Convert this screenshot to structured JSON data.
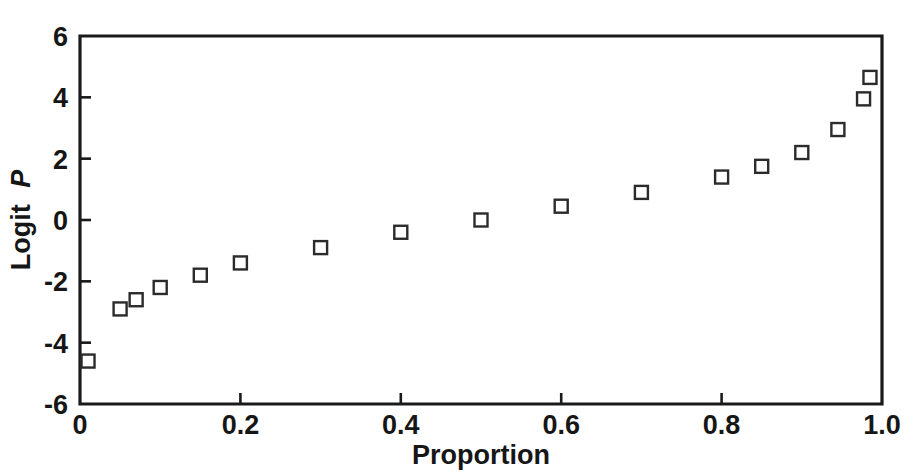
{
  "chart_data": {
    "type": "scatter",
    "title": "",
    "xlabel": "Proportion",
    "ylabel": "Logit P",
    "ylabel_plain": "Logit",
    "ylabel_italic": "P",
    "xlim": [
      0,
      1.0
    ],
    "ylim": [
      -6,
      6
    ],
    "grid": false,
    "legend": null,
    "marker": "open-square",
    "marker_color": "#2b2b2b",
    "x_ticks": [
      0,
      0.2,
      0.4,
      0.6,
      0.8,
      1.0
    ],
    "x_tick_labels": [
      "0",
      "0.2",
      "0.4",
      "0.6",
      "0.8",
      "1.0"
    ],
    "y_ticks": [
      -6,
      -4,
      -2,
      0,
      2,
      4,
      6
    ],
    "y_tick_labels": [
      "-6",
      "-4",
      "-2",
      "0",
      "2",
      "4",
      "6"
    ],
    "x": [
      0.01,
      0.05,
      0.07,
      0.1,
      0.15,
      0.2,
      0.3,
      0.4,
      0.5,
      0.6,
      0.7,
      0.8,
      0.85,
      0.9,
      0.945,
      0.977,
      0.985
    ],
    "values": [
      -4.6,
      -2.9,
      -2.6,
      -2.2,
      -1.8,
      -1.4,
      -0.9,
      -0.4,
      0.0,
      0.45,
      0.9,
      1.4,
      1.75,
      2.2,
      2.95,
      3.95,
      4.65
    ],
    "points": [
      {
        "x": 0.01,
        "y": -4.6
      },
      {
        "x": 0.05,
        "y": -2.9
      },
      {
        "x": 0.07,
        "y": -2.6
      },
      {
        "x": 0.1,
        "y": -2.2
      },
      {
        "x": 0.15,
        "y": -1.8
      },
      {
        "x": 0.2,
        "y": -1.4
      },
      {
        "x": 0.3,
        "y": -0.9
      },
      {
        "x": 0.4,
        "y": -0.4
      },
      {
        "x": 0.5,
        "y": 0.0
      },
      {
        "x": 0.6,
        "y": 0.45
      },
      {
        "x": 0.7,
        "y": 0.9
      },
      {
        "x": 0.8,
        "y": 1.4
      },
      {
        "x": 0.85,
        "y": 1.75
      },
      {
        "x": 0.9,
        "y": 2.2
      },
      {
        "x": 0.945,
        "y": 2.95
      },
      {
        "x": 0.977,
        "y": 3.95
      },
      {
        "x": 0.985,
        "y": 4.65
      }
    ]
  },
  "plot_area": {
    "left_px": 80,
    "right_px": 882,
    "top_px": 36,
    "bottom_px": 404
  }
}
